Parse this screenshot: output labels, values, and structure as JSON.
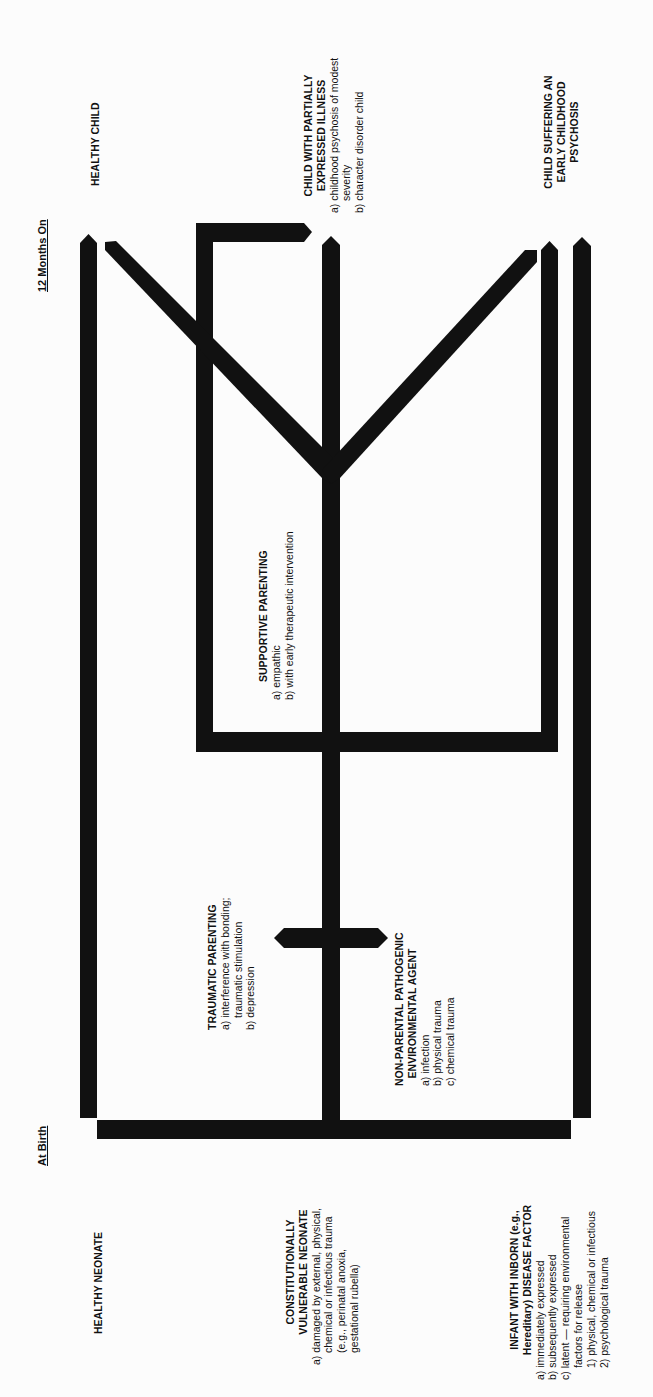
{
  "timeline": {
    "start_label": "At Birth",
    "end_label": "12 Months On"
  },
  "origins": {
    "healthy": {
      "title": "HEALTHY NEONATE"
    },
    "vulnerable": {
      "title_line1": "CONSTITUTIONALLY",
      "title_line2": "VULNERABLE NEONATE",
      "items": [
        "a) damaged by external, physical,",
        "chemical or infectious trauma",
        "(e.g., perinatal anoxia,",
        "gestational rubella)"
      ]
    },
    "inborn": {
      "title_line1": "INFANT WITH INBORN (e.g.,",
      "title_line2": "Hereditary) DISEASE FACTOR",
      "items": [
        "a) immediately expressed",
        "b) subsequently expressed",
        "c) latent — requiring environmental",
        "factors for release",
        "1) physical, chemical or infectious",
        "2) psychological trauma"
      ]
    }
  },
  "influences": {
    "traumatic": {
      "title": "TRAUMATIC PARENTING",
      "items": [
        "a) interference with bonding;",
        "traumatic stimulation",
        "b) depression"
      ]
    },
    "nonparental": {
      "title_line1": "NON-PARENTAL PATHOGENIC",
      "title_line2": "ENVIRONMENTAL AGENT",
      "items": [
        "a) infection",
        "b) physical trauma",
        "c) chemical trauma"
      ]
    },
    "supportive": {
      "title": "SUPPORTIVE PARENTING",
      "items": [
        "a) empathic",
        "b) with early therapeutic intervention"
      ]
    }
  },
  "outcomes": {
    "healthy": {
      "title": "HEALTHY CHILD"
    },
    "partial": {
      "title_line1": "CHILD WITH PARTIALLY",
      "title_line2": "EXPRESSED ILLNESS",
      "items": [
        "a) childhood psychosis of modest",
        "severity",
        "b) character disorder child"
      ]
    },
    "psychosis": {
      "title_line1": "CHILD SUFFERING AN",
      "title_line2": "EARLY CHILDHOOD",
      "title_line3": "PSYCHOSIS"
    }
  },
  "colors": {
    "ink": "#111111",
    "background": "#fcfcfc"
  }
}
